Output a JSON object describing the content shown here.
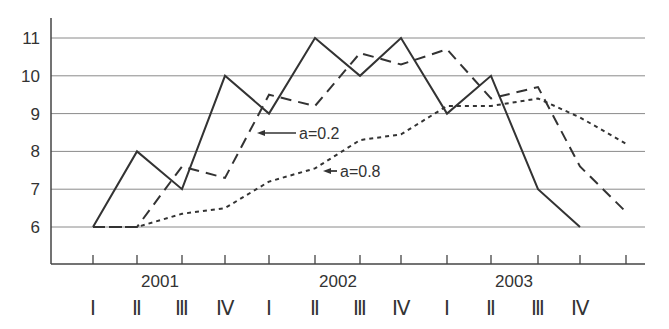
{
  "chart_data": {
    "type": "line",
    "title": "",
    "xlabel": "",
    "ylabel": "",
    "ylim": [
      5,
      11.5
    ],
    "yticks": [
      6,
      7,
      8,
      9,
      10,
      11
    ],
    "grid": true,
    "legend_position": "inline annotations",
    "years": [
      "2001",
      "2002",
      "2003"
    ],
    "quarters": [
      "I",
      "II",
      "III",
      "IV",
      "I",
      "II",
      "III",
      "IV",
      "I",
      "II",
      "III",
      "IV"
    ],
    "categories": [
      "2001 I",
      "2001 II",
      "2001 III",
      "2001 IV",
      "2002 I",
      "2002 II",
      "2002 III",
      "2002 IV",
      "2003 I",
      "2003 II",
      "2003 III",
      "2003 IV",
      "2004 I"
    ],
    "series": [
      {
        "name": "actual",
        "style": "solid",
        "values": [
          6,
          8,
          7,
          10,
          9,
          11,
          10,
          11,
          9,
          10,
          7,
          6,
          null
        ]
      },
      {
        "name": "a=0.2",
        "style": "dashed",
        "values": [
          6,
          6,
          7.6,
          7.3,
          9.5,
          9.2,
          10.6,
          10.3,
          10.7,
          9.4,
          9.7,
          7.6,
          6.4
        ]
      },
      {
        "name": "a=0.8",
        "style": "dotted",
        "values": [
          6,
          6,
          6.35,
          6.5,
          7.2,
          7.55,
          8.3,
          8.45,
          9.2,
          9.2,
          9.4,
          8.9,
          8.2
        ]
      }
    ],
    "annotations": [
      {
        "text": "a=0.2",
        "target_series": "a=0.2"
      },
      {
        "text": "a=0.8",
        "target_series": "a=0.8"
      }
    ]
  },
  "colors": {
    "line": "#333333",
    "grid": "#8a8a8a",
    "axis": "#444444"
  }
}
